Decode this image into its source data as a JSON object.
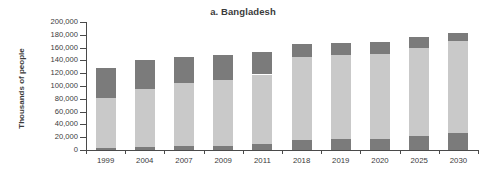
{
  "chart_data": {
    "type": "bar",
    "subtype": "stacked-vertical",
    "title": "a. Bangladesh",
    "xlabel": "",
    "ylabel": "Thousands of people",
    "categories": [
      "1999",
      "2004",
      "2007",
      "2009",
      "2011",
      "2018",
      "2019",
      "2020",
      "2025",
      "2030"
    ],
    "ylim": [
      0,
      200000
    ],
    "ytick_values": [
      0,
      20000,
      40000,
      60000,
      80000,
      100000,
      120000,
      140000,
      160000,
      180000,
      200000
    ],
    "ytick_labels": [
      "0",
      "20,000",
      "40,000",
      "60,000",
      "80,000",
      "100,000",
      "120,000",
      "140,000",
      "160,000",
      "180,000",
      "200,000"
    ],
    "grid": false,
    "legend": false,
    "series": [
      {
        "name": "bottom-segment",
        "color": "#7b7b7b",
        "values": [
          3000,
          5000,
          6000,
          7000,
          9000,
          16000,
          17000,
          17500,
          22000,
          27000
        ]
      },
      {
        "name": "middle-segment",
        "color": "#c9c9c9",
        "values": [
          79000,
          90000,
          98000,
          103000,
          109000,
          129000,
          131000,
          132500,
          138000,
          143000
        ]
      },
      {
        "name": "top-segment",
        "color": "#7b7b7b",
        "values": [
          46000,
          46000,
          42000,
          39000,
          35000,
          20000,
          19000,
          18000,
          16000,
          13000
        ]
      }
    ],
    "cumulative_tops": {
      "bottom": [
        3000,
        5000,
        6000,
        7000,
        9000,
        16000,
        17000,
        17500,
        22000,
        27000
      ],
      "middle": [
        82000,
        95000,
        104000,
        110000,
        118000,
        145000,
        148000,
        150000,
        160000,
        170000
      ],
      "total": [
        128000,
        141000,
        146000,
        149000,
        153000,
        165000,
        167000,
        168000,
        176000,
        183000
      ]
    },
    "colors": {
      "dark": "#7b7b7b",
      "light": "#c9c9c9",
      "axis": "#4a4a4a",
      "text": "#3b3b3b",
      "background": "#ffffff"
    }
  }
}
